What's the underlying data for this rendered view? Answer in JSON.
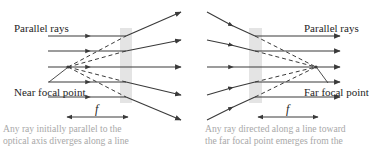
{
  "colors": {
    "ray": "#3a3a3a",
    "dashed": "#3a3a3a",
    "lens": "#e4e4e4",
    "label": "#1e1e1e",
    "caption": "#a8a8a8",
    "background": "#ffffff"
  },
  "left_panel": {
    "title_label": "Parallel rays",
    "focal_label": "Near focal point",
    "f_label": "f",
    "caption_line1": "Any ray initially parallel to the",
    "caption_line2": "optical axis diverges along a line"
  },
  "right_panel": {
    "title_label": "Parallel rays",
    "focal_label": "Far focal point",
    "f_label": "f",
    "caption_line1": "Any ray directed along a line toward",
    "caption_line2": "the far focal point emerges from the"
  }
}
